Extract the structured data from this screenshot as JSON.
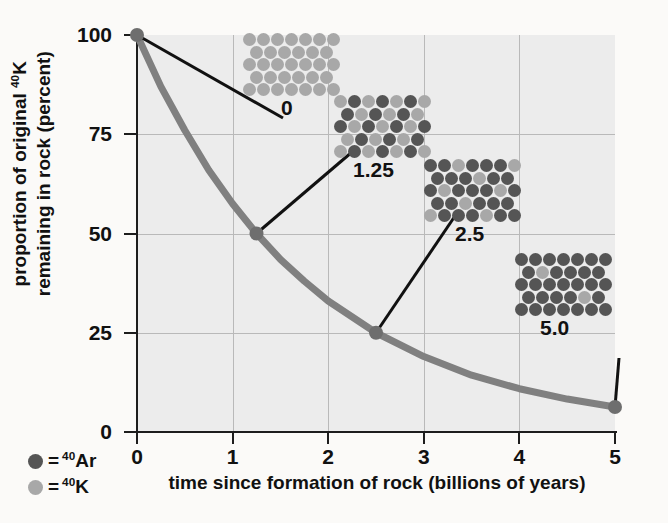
{
  "chart_data": {
    "type": "line",
    "title": "",
    "xlabel": "time since formation of rock (billions of years)",
    "ylabel_line1": "proportion of original ",
    "ylabel_sup": "40",
    "ylabel_line1b": "K",
    "ylabel_line2": "remaining in rock (percent)",
    "xlim": [
      0,
      5
    ],
    "ylim": [
      0,
      100
    ],
    "xticks": [
      "0",
      "1",
      "2",
      "3",
      "4",
      "5"
    ],
    "xtick_values": [
      0,
      1,
      2,
      3,
      4,
      5
    ],
    "yticks": [
      "0",
      "25",
      "50",
      "75",
      "100"
    ],
    "ytick_values": [
      0,
      25,
      50,
      75,
      100
    ],
    "grid": "both",
    "series": [
      {
        "name": "proportion of original 40K remaining",
        "color": "#808080",
        "x": [
          0,
          0.25,
          0.5,
          0.75,
          1.0,
          1.25,
          1.5,
          1.75,
          2.0,
          2.5,
          3.0,
          3.5,
          4.0,
          4.5,
          5.0
        ],
        "y": [
          100,
          87,
          76,
          66,
          57.5,
          50,
          43.5,
          38,
          33,
          25,
          19,
          14.3,
          10.9,
          8.3,
          6.3
        ]
      }
    ],
    "markers": [
      {
        "label": "0",
        "x": 0,
        "y": 100
      },
      {
        "label": "1.25",
        "x": 1.25,
        "y": 50
      },
      {
        "label": "2.5",
        "x": 2.5,
        "y": 25
      },
      {
        "label": "5.0",
        "x": 5.0,
        "y": 6.3
      }
    ],
    "annotations": [
      {
        "label": "0",
        "description": "all 40K, no 40Ar",
        "k_fraction": 1.0,
        "total_dots": 33
      },
      {
        "label": "1.25",
        "description": "half 40K, half 40Ar (1 half-life)",
        "k_fraction": 0.5,
        "total_dots": 33
      },
      {
        "label": "2.5",
        "description": "quarter 40K (2 half-lives)",
        "k_fraction": 0.25,
        "total_dots": 33
      },
      {
        "label": "5.0",
        "description": "nearly all 40Ar (4 half-lives)",
        "k_fraction": 0.0625,
        "total_dots": 33
      }
    ]
  },
  "legend": {
    "position": "bottom-left",
    "items": [
      {
        "symbol": "dark-dot",
        "equals": "=",
        "sup": "40",
        "element": "Ar",
        "color": "#555555"
      },
      {
        "symbol": "light-dot",
        "equals": "=",
        "sup": "40",
        "element": "K",
        "color": "#a8a8a8"
      }
    ]
  },
  "colors": {
    "curve": "#808080",
    "plot_background": "#ececec",
    "page_background": "#fbfaf8",
    "axis": "#1d1d1d",
    "gridline": "#b9b9b9",
    "ar_dot": "#555555",
    "k_dot": "#a8a8a8",
    "callout": "#111111"
  }
}
